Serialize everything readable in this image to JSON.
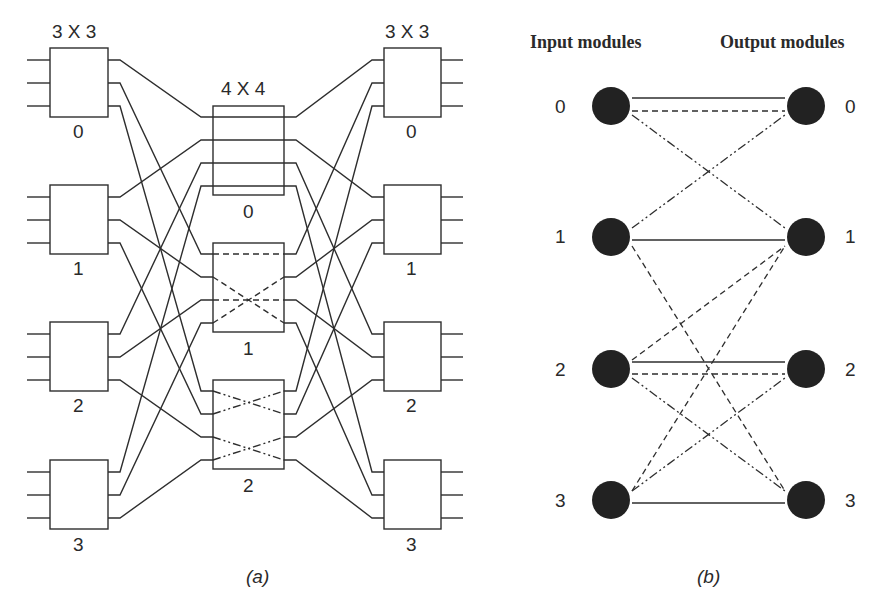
{
  "panel_a": {
    "caption": "(a)",
    "input_stage_label": "3 X 3",
    "middle_stage_label": "4 X 4",
    "output_stage_label": "3 X 3",
    "input_modules": [
      "0",
      "1",
      "2",
      "3"
    ],
    "middle_modules": [
      "0",
      "1",
      "2"
    ],
    "output_modules": [
      "0",
      "1",
      "2",
      "3"
    ],
    "internal_patterns": {
      "middle_0": "straight (solid)",
      "middle_1": "straight + crossed (dashed)",
      "middle_2": "crossed pairs (dash-dot)"
    }
  },
  "panel_b": {
    "caption": "(b)",
    "input_header": "Input modules",
    "output_header": "Output modules",
    "input_nodes": [
      "0",
      "1",
      "2",
      "3"
    ],
    "output_nodes": [
      "0",
      "1",
      "2",
      "3"
    ],
    "edges": [
      {
        "from": 0,
        "to": 0,
        "style": "solid"
      },
      {
        "from": 0,
        "to": 0,
        "style": "dashed"
      },
      {
        "from": 0,
        "to": 1,
        "style": "dash-dot"
      },
      {
        "from": 1,
        "to": 0,
        "style": "dash-dot"
      },
      {
        "from": 1,
        "to": 1,
        "style": "solid"
      },
      {
        "from": 1,
        "to": 3,
        "style": "dashed"
      },
      {
        "from": 2,
        "to": 1,
        "style": "dashed"
      },
      {
        "from": 2,
        "to": 2,
        "style": "solid"
      },
      {
        "from": 2,
        "to": 2,
        "style": "dashed"
      },
      {
        "from": 2,
        "to": 3,
        "style": "dash-dot"
      },
      {
        "from": 3,
        "to": 2,
        "style": "dash-dot"
      },
      {
        "from": 3,
        "to": 1,
        "style": "dashed"
      },
      {
        "from": 3,
        "to": 3,
        "style": "solid"
      }
    ]
  },
  "colors": {
    "ink": "#2e2e2e",
    "node_fill": "#222222",
    "background": "#ffffff"
  }
}
